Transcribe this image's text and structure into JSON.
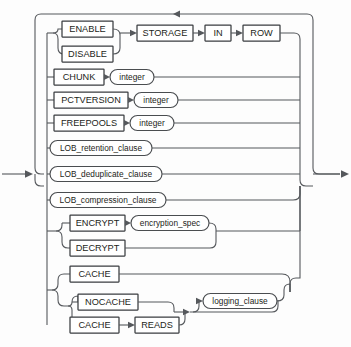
{
  "diagram": {
    "kind": "railroad-syntax-diagram",
    "colors": {
      "background": "#fdfdfd",
      "rail": "#55585c",
      "box_border": "#3a3d40",
      "text": "#1c1e20"
    },
    "entry_arrow": {
      "label": "entry",
      "direction": "right"
    },
    "exit_arrow": {
      "label": "exit",
      "direction": "right"
    },
    "loop_arrow": {
      "label": "repeat-loop",
      "direction": "left"
    },
    "keywords": [
      {
        "id": "enable",
        "label": "ENABLE",
        "x": 62,
        "y": 21,
        "w": 51,
        "h": 16
      },
      {
        "id": "disable",
        "label": "DISABLE",
        "x": 62,
        "y": 46,
        "w": 51,
        "h": 16
      },
      {
        "id": "storage",
        "label": "STORAGE",
        "x": 137,
        "y": 33,
        "w": 56,
        "h": 16
      },
      {
        "id": "in",
        "label": "IN",
        "x": 205,
        "y": 33,
        "w": 26,
        "h": 16
      },
      {
        "id": "row",
        "label": "ROW",
        "x": 243,
        "y": 33,
        "w": 37,
        "h": 16
      },
      {
        "id": "chunk",
        "label": "CHUNK",
        "x": 54,
        "y": 69,
        "w": 50,
        "h": 16
      },
      {
        "id": "pctversion",
        "label": "PCTVERSION",
        "x": 54,
        "y": 92,
        "w": 74,
        "h": 16
      },
      {
        "id": "freepools",
        "label": "FREEPOOLS",
        "x": 54,
        "y": 115,
        "w": 70,
        "h": 16
      },
      {
        "id": "encrypt",
        "label": "ENCRYPT",
        "x": 70,
        "y": 215,
        "w": 55,
        "h": 16
      },
      {
        "id": "decrypt",
        "label": "DECRYPT",
        "x": 70,
        "y": 240,
        "w": 55,
        "h": 16
      },
      {
        "id": "cache",
        "label": "CACHE",
        "x": 70,
        "y": 266,
        "w": 49,
        "h": 16
      },
      {
        "id": "nocache",
        "label": "NOCACHE",
        "x": 78,
        "y": 294,
        "w": 60,
        "h": 16
      },
      {
        "id": "cache2",
        "label": "CACHE",
        "x": 70,
        "y": 317,
        "w": 49,
        "h": 16
      },
      {
        "id": "reads",
        "label": "READS",
        "x": 135,
        "y": 317,
        "w": 44,
        "h": 16
      }
    ],
    "nonterminals": [
      {
        "id": "chunk-integer",
        "label": "integer",
        "x": 110,
        "y": 68,
        "w": 44,
        "h": 15
      },
      {
        "id": "pctversion-integer",
        "label": "integer",
        "x": 134,
        "y": 91,
        "w": 44,
        "h": 15
      },
      {
        "id": "freepools-integer",
        "label": "integer",
        "x": 130,
        "y": 114,
        "w": 44,
        "h": 15
      },
      {
        "id": "lob-retention-clause",
        "label": "LOB_retention_clause",
        "x": 50,
        "y": 140,
        "w": 102,
        "h": 15
      },
      {
        "id": "lob-deduplicate-clause",
        "label": "LOB_deduplicate_clause",
        "x": 50,
        "y": 166,
        "w": 112,
        "h": 15
      },
      {
        "id": "lob-compression-clause",
        "label": "LOB_compression_clause",
        "x": 50,
        "y": 192,
        "w": 116,
        "h": 15
      },
      {
        "id": "encryption-spec",
        "label": "encryption_spec",
        "x": 131,
        "y": 214,
        "w": 78,
        "h": 15
      },
      {
        "id": "logging-clause",
        "label": "logging_clause",
        "x": 203,
        "y": 293,
        "w": 74,
        "h": 15
      }
    ],
    "branches": [
      "ENABLE | DISABLE  STORAGE IN ROW",
      "CHUNK integer",
      "PCTVERSION integer",
      "FREEPOOLS integer",
      "LOB_retention_clause",
      "LOB_deduplicate_clause",
      "LOB_compression_clause",
      "ENCRYPT encryption_spec | DECRYPT",
      "CACHE",
      "NOCACHE | CACHE READS  [logging_clause]"
    ]
  }
}
